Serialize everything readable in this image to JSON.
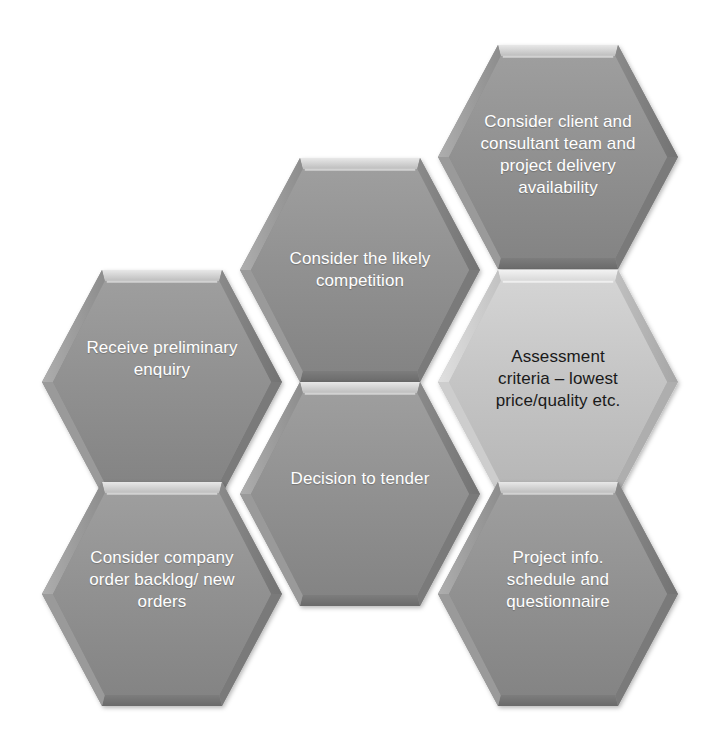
{
  "diagram": {
    "type": "honeycomb",
    "background_color": "#ffffff",
    "colors": {
      "hex_fill_dark": "#909090",
      "hex_fill_dark_top": "#9b9b9b",
      "hex_fill_dark_bottom": "#848484",
      "hex_fill_light": "#c7c7c7",
      "hex_fill_light_top": "#d2d2d2",
      "hex_fill_light_bottom": "#bababa",
      "bevel_highlight": "#e2e2e2",
      "bevel_shadow": "#6e6e6e",
      "text_light": "#ffffff",
      "text_dark": "#1a1a1a"
    },
    "nodes": [
      {
        "id": "consider-client-consultant",
        "label": "Consider client and\nconsultant team and\nproject delivery\navailability",
        "fill": "dark",
        "text_color": "light",
        "font_size": 17,
        "center": {
          "x": 558,
          "y": 157
        },
        "label_offset_y": -2,
        "column": "right",
        "row": 1
      },
      {
        "id": "consider-likely-competition",
        "label": "Consider the likely\ncompetition",
        "fill": "dark",
        "text_color": "light",
        "font_size": 17,
        "center": {
          "x": 360,
          "y": 270
        },
        "label_offset_y": 0,
        "column": "middle",
        "row": 1
      },
      {
        "id": "assessment-criteria",
        "label": "Assessment\ncriteria – lowest\nprice/quality etc.",
        "fill": "light",
        "text_color": "dark",
        "font_size": 17,
        "center": {
          "x": 558,
          "y": 382
        },
        "label_offset_y": -3,
        "column": "right",
        "row": 2
      },
      {
        "id": "receive-preliminary-enquiry",
        "label": "Receive preliminary\nenquiry",
        "fill": "dark",
        "text_color": "light",
        "font_size": 17,
        "center": {
          "x": 162,
          "y": 382
        },
        "label_offset_y": -23,
        "column": "left",
        "row": 1
      },
      {
        "id": "decision-to-tender",
        "label": "Decision to tender",
        "fill": "dark",
        "text_color": "light",
        "font_size": 17,
        "center": {
          "x": 360,
          "y": 494
        },
        "label_offset_y": -15,
        "column": "middle",
        "row": 2
      },
      {
        "id": "consider-company-order-backlog",
        "label": "Consider company\norder backlog/ new\norders",
        "fill": "dark",
        "text_color": "light",
        "font_size": 17,
        "center": {
          "x": 162,
          "y": 594
        },
        "label_offset_y": -14,
        "column": "left",
        "row": 2
      },
      {
        "id": "project-info-schedule-questionnaire",
        "label": "Project info.\nschedule and\nquestionnaire",
        "fill": "dark",
        "text_color": "light",
        "font_size": 17,
        "center": {
          "x": 558,
          "y": 594
        },
        "label_offset_y": -14,
        "column": "right",
        "row": 3
      }
    ],
    "geometry": {
      "half_width": 120,
      "half_height": 112,
      "flat_half_width": 60,
      "orientation": "flat-top"
    }
  }
}
